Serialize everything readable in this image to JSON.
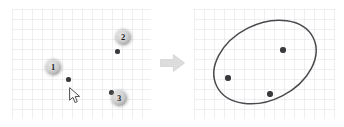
{
  "figure": {
    "background_color": "#ffffff",
    "grid_color": "#bec4cd",
    "grid_spacing_px": 10,
    "point_color": "#3a3a3c",
    "badge_color": "#cfcfcf",
    "ellipse_stroke_color": "#4a4a4c",
    "arrow_color": "#dcdcdc"
  },
  "left_panel": {
    "name": "input-points-panel",
    "caption": "",
    "markers": [
      {
        "label": "1",
        "badge_x": 41,
        "badge_y": 58,
        "dot_x": 56,
        "dot_y": 70
      },
      {
        "label": "2",
        "badge_x": 111,
        "badge_y": 28,
        "dot_x": 105,
        "dot_y": 42
      },
      {
        "label": "3",
        "badge_x": 107,
        "badge_y": 89,
        "dot_x": 99,
        "dot_y": 83
      }
    ],
    "cursor": {
      "name": "mouse-pointer",
      "x": 57,
      "y": 78
    }
  },
  "transition": {
    "name": "right-arrow",
    "glyph": "arrow-right"
  },
  "right_panel": {
    "name": "fitted-ellipse-panel",
    "caption": "",
    "ellipse": {
      "cx": 71,
      "cy": 53,
      "rx": 54,
      "ry": 38,
      "rotation_deg": -27
    },
    "points": [
      {
        "id": "p1",
        "x": 89,
        "y": 41
      },
      {
        "id": "p2",
        "x": 34,
        "y": 69
      },
      {
        "id": "p3",
        "x": 76,
        "y": 85
      }
    ]
  },
  "chart_data": {
    "type": "scatter",
    "xlabel": "",
    "ylabel": "",
    "panels": [
      {
        "name": "left",
        "description": "Three selected data points with numbered selection badges and mouse cursor",
        "series": [
          {
            "name": "selected points",
            "labels": [
              "1",
              "2",
              "3"
            ],
            "x": [
              56,
              105,
              99
            ],
            "y": [
              70,
              42,
              83
            ]
          }
        ]
      },
      {
        "name": "right",
        "description": "Ellipse fitted through the three points",
        "series": [
          {
            "name": "points",
            "x": [
              89,
              34,
              76
            ],
            "y": [
              41,
              69,
              85
            ]
          }
        ],
        "ellipse": {
          "cx": 71,
          "cy": 53,
          "rx": 54,
          "ry": 38,
          "rotation_deg": -27
        }
      }
    ]
  }
}
